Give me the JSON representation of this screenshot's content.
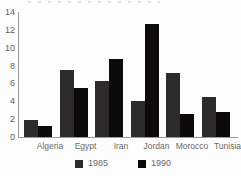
{
  "chart_data": {
    "type": "bar",
    "categories": [
      "Algeria",
      "Egypt",
      "Iran",
      "Jordan",
      "Morocco",
      "Tunisia"
    ],
    "series": [
      {
        "name": "1985",
        "color": "#2d2a2b",
        "values": [
          1.9,
          7.5,
          6.3,
          4.0,
          7.2,
          4.5
        ]
      },
      {
        "name": "1990",
        "color": "#0c0a0b",
        "values": [
          1.2,
          5.5,
          8.7,
          12.6,
          2.6,
          2.8
        ]
      }
    ],
    "ylim": [
      0,
      14
    ],
    "yticks": [
      0,
      2,
      4,
      6,
      8,
      10,
      12,
      14
    ],
    "xlabel": "",
    "ylabel": "",
    "grid": false,
    "legend_position": "bottom"
  },
  "colors": {
    "axis": "#9a9a9a",
    "tick_label": "#5e5e5e",
    "category_label": "#6a6a6a",
    "background": "#fdfdfd"
  }
}
